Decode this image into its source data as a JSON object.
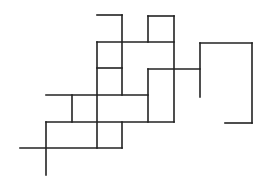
{
  "diagram": {
    "type": "line-drawing",
    "stroke_color": "#222222",
    "background": "#ffffff",
    "segments": [
      {
        "x1": 97,
        "y1": 15,
        "x2": 122,
        "y2": 15
      },
      {
        "x1": 122,
        "y1": 15,
        "x2": 122,
        "y2": 95
      },
      {
        "x1": 148,
        "y1": 16,
        "x2": 174,
        "y2": 16
      },
      {
        "x1": 148,
        "y1": 16,
        "x2": 148,
        "y2": 42
      },
      {
        "x1": 174,
        "y1": 16,
        "x2": 174,
        "y2": 122
      },
      {
        "x1": 97,
        "y1": 42,
        "x2": 174,
        "y2": 42
      },
      {
        "x1": 97,
        "y1": 42,
        "x2": 97,
        "y2": 148
      },
      {
        "x1": 97,
        "y1": 68,
        "x2": 122,
        "y2": 68
      },
      {
        "x1": 148,
        "y1": 69,
        "x2": 200,
        "y2": 69
      },
      {
        "x1": 148,
        "y1": 69,
        "x2": 148,
        "y2": 122
      },
      {
        "x1": 200,
        "y1": 43,
        "x2": 252,
        "y2": 43
      },
      {
        "x1": 200,
        "y1": 43,
        "x2": 200,
        "y2": 97
      },
      {
        "x1": 252,
        "y1": 43,
        "x2": 252,
        "y2": 123
      },
      {
        "x1": 225,
        "y1": 123,
        "x2": 252,
        "y2": 123
      },
      {
        "x1": 46,
        "y1": 95,
        "x2": 148,
        "y2": 95
      },
      {
        "x1": 72,
        "y1": 95,
        "x2": 72,
        "y2": 122
      },
      {
        "x1": 46,
        "y1": 122,
        "x2": 174,
        "y2": 122
      },
      {
        "x1": 46,
        "y1": 122,
        "x2": 46,
        "y2": 175
      },
      {
        "x1": 122,
        "y1": 122,
        "x2": 122,
        "y2": 148
      },
      {
        "x1": 20,
        "y1": 148,
        "x2": 122,
        "y2": 148
      }
    ]
  }
}
